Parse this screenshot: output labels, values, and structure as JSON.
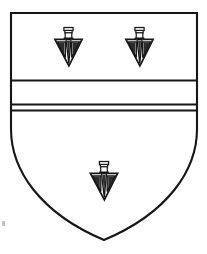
{
  "image": {
    "kind": "heraldic-shield",
    "title": "Coat of arms",
    "description": "Heraldic escutcheon with three pheons and a fess",
    "width": 207,
    "height": 254,
    "background_color": "#ffffff"
  },
  "shield": {
    "name": "escutcheon",
    "outline_color": "#161616",
    "field_color": "#ffffff",
    "outline_width": 2.1,
    "geometry": {
      "left": 11,
      "right": 197,
      "top": 13,
      "bottom_point_x": 104,
      "bottom_point_y": 240,
      "straight_side_until_y": 140
    }
  },
  "ordinary": {
    "name": "fess",
    "type": "horizontal-band",
    "line_color": "#161616",
    "line_width": 1.8,
    "lines_y": [
      80.5,
      104.5,
      110.5
    ],
    "band_top_y": 80.5,
    "band_bottom_y": 110.5,
    "inner_line_y": 104.5
  },
  "charges": {
    "name": "pheon",
    "label": "pheon (broad arrowhead, point downward)",
    "count": 3,
    "arrangement": "two in chief, one in base",
    "fill_color": "#ffffff",
    "outline_color": "#161616",
    "shading_color": "#1a1a1a",
    "items": [
      {
        "id": "pheon-chief-dexter",
        "position": "chief dexter",
        "cx": 68.5,
        "cy": 47,
        "scale": 1.0
      },
      {
        "id": "pheon-chief-sinister",
        "position": "chief sinister",
        "cx": 139.5,
        "cy": 47,
        "scale": 1.0
      },
      {
        "id": "pheon-base",
        "position": "base",
        "cx": 104,
        "cy": 181,
        "scale": 1.0
      }
    ]
  },
  "artifact": {
    "name": "scan-speck",
    "visible": true,
    "color": "#b9b9bd"
  }
}
